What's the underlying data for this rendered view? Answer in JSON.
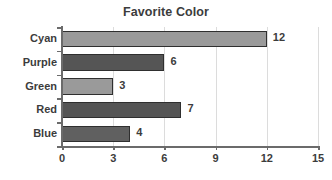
{
  "chart_data": {
    "type": "bar",
    "orientation": "horizontal",
    "title": "Favorite Color",
    "xlabel": "",
    "ylabel": "",
    "categories": [
      "Cyan",
      "Purple",
      "Green",
      "Red",
      "Blue"
    ],
    "values": [
      12,
      6,
      3,
      7,
      4
    ],
    "value_labels": [
      "12",
      "6",
      "3",
      "7",
      "4"
    ],
    "xlim": [
      0,
      15
    ],
    "xticks": [
      0,
      3,
      6,
      9,
      12,
      15
    ],
    "xtick_labels": [
      "0",
      "3",
      "6",
      "9",
      "12",
      "15"
    ],
    "grid": "vertical",
    "legend": "none",
    "bar_colors": [
      "#9a9a9a",
      "#555555",
      "#9a9a9a",
      "#555555",
      "#606060"
    ],
    "bar_edge_color": "#2f2f2f",
    "text_color": "#3c3c3c",
    "gridline_color": "#dcdcdc",
    "axis_color": "#6b6b6b",
    "background": "#ffffff"
  }
}
